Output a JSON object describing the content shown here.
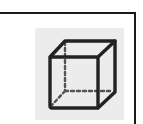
{
  "panel": {
    "border_color": "#1a1a1a",
    "background": "#ffffff"
  },
  "tool_button": {
    "icon": "cube-3d-icon",
    "tile_color": "#ececec",
    "stroke_color": "#222222",
    "state": "normal"
  }
}
